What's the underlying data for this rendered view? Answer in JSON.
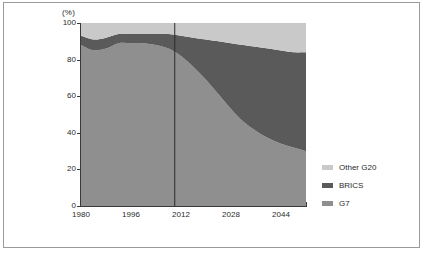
{
  "figure": {
    "y_axis_unit": "(%)"
  },
  "legend": {
    "items": [
      {
        "label": "Other G20",
        "color": "#c9c9c9",
        "name": "other-g20"
      },
      {
        "label": "BRICS",
        "color": "#5a5a5a",
        "name": "brics"
      },
      {
        "label": "G7",
        "color": "#8f8f8f",
        "name": "g7"
      }
    ]
  },
  "chart_data": {
    "type": "area",
    "stacked": true,
    "title": "",
    "xlabel": "",
    "ylabel": "(%)",
    "xlim": [
      1980,
      2052
    ],
    "ylim": [
      0,
      100
    ],
    "grid": false,
    "legend_position": "right",
    "xticks": [
      1980,
      1996,
      2012,
      2028,
      2044
    ],
    "xtick_labels": [
      "1980",
      "1996",
      "2012",
      "2028",
      "2044"
    ],
    "yticks": [
      0,
      20,
      40,
      60,
      80,
      100
    ],
    "ytick_labels": [
      "0",
      "20",
      "40",
      "60",
      "80",
      "100"
    ],
    "x": [
      1980,
      1984,
      1988,
      1992,
      1996,
      2000,
      2004,
      2008,
      2012,
      2016,
      2020,
      2024,
      2028,
      2032,
      2036,
      2040,
      2044,
      2048,
      2052
    ],
    "series": [
      {
        "name": "G7",
        "color": "#8f8f8f",
        "values": [
          88,
          85,
          86,
          89,
          89,
          89,
          88,
          86,
          82,
          76,
          69,
          61,
          53,
          46,
          41,
          37,
          34,
          32,
          30
        ]
      },
      {
        "name": "BRICS",
        "color": "#5a5a5a",
        "values": [
          5,
          6,
          6,
          5,
          5,
          5,
          6,
          8,
          11,
          16,
          22,
          29,
          36,
          42,
          46,
          49,
          51,
          52,
          54
        ]
      },
      {
        "name": "Other G20",
        "color": "#c9c9c9",
        "values": [
          7,
          9,
          8,
          6,
          6,
          6,
          6,
          6,
          7,
          8,
          9,
          10,
          11,
          12,
          13,
          14,
          15,
          16,
          16
        ]
      }
    ],
    "annotations": [
      {
        "type": "vertical-line",
        "x": 2010,
        "name": "forecast-divider"
      }
    ]
  }
}
